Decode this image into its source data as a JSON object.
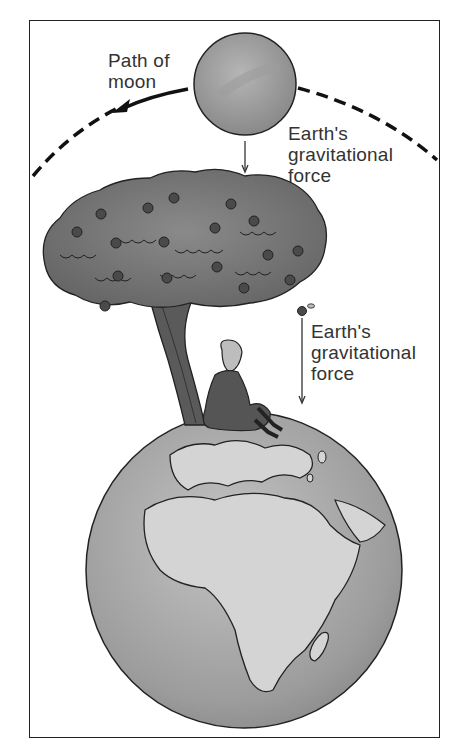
{
  "diagram": {
    "labels": {
      "path_of_moon": [
        "Path of",
        "moon"
      ],
      "moon_force": [
        "Earth's",
        "gravitational",
        "force"
      ],
      "apple_force": [
        "Earth's",
        "gravitational",
        "force"
      ]
    },
    "objects": {
      "moon": "moon",
      "earth": "Earth (Africa and Europe visible)",
      "tree": "apple tree",
      "person": "Isaac Newton seated under tree",
      "apple": "falling apple"
    },
    "colors": {
      "frame": "#222222",
      "text": "#333333",
      "moon_fill": "#9a9a9a",
      "earth_ocean": "#a8a8a8",
      "earth_land": "#d4d4d4",
      "tree_canopy": "#7a7a7a",
      "apple": "#4a4a4a"
    }
  }
}
